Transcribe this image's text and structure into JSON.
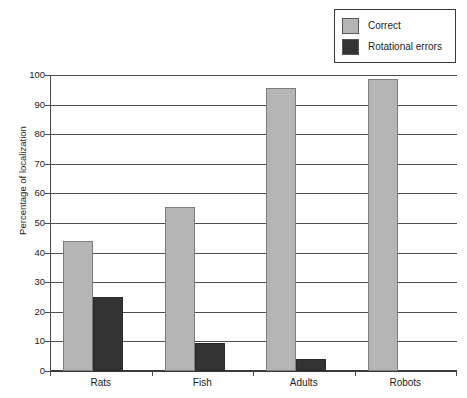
{
  "chart_data": {
    "type": "bar",
    "title": "",
    "subtitle": "",
    "xlabel": "",
    "ylabel": "Percentage of localization",
    "categories": [
      "Rats",
      "Fish",
      "Adults",
      "Robots"
    ],
    "series": [
      {
        "name": "Correct",
        "values": [
          44,
          55.5,
          95.5,
          98.5
        ],
        "color": "#b5b5b5"
      },
      {
        "name": "Rotational errors",
        "values": [
          25,
          9.5,
          4,
          0
        ],
        "color": "#333333"
      }
    ],
    "ylim": [
      0,
      100
    ],
    "ytick_step": 10,
    "yticks": [
      100,
      90,
      80,
      70,
      60,
      50,
      40,
      30,
      20,
      10,
      0
    ],
    "grid": true,
    "legend_position": "top-right",
    "annotations": []
  },
  "legend": {
    "entries": [
      {
        "label": "Correct",
        "swatch": "light-gray-swatch"
      },
      {
        "label": "Rotational errors",
        "swatch": "dark-gray-swatch"
      }
    ]
  },
  "axes": {
    "y_title": "Percentage of localization",
    "y_tick_labels": [
      "100",
      "90",
      "80",
      "70",
      "60",
      "50",
      "40",
      "30",
      "20",
      "10",
      "0"
    ],
    "x_tick_labels": [
      "Rats",
      "Fish",
      "Adults",
      "Robots"
    ]
  },
  "colors": {
    "correct": "#b5b5b5",
    "rotational_errors": "#333333",
    "axis": "#4a4a4a",
    "grid": "#4f4f4f",
    "background": "#ffffff"
  }
}
